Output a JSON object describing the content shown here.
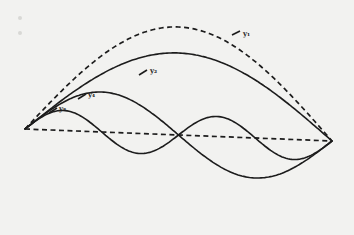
{
  "diagram": {
    "type": "standing-wave-modes",
    "endpoints": {
      "left": [
        25,
        129
      ],
      "right": [
        332,
        141
      ]
    },
    "baseline_style": "dashed",
    "curves": [
      {
        "id": "y1",
        "label": "y₁",
        "harmonic": 1,
        "amplitude": 108,
        "style": "dashed",
        "envelope": true,
        "label_pos": [
          243,
          36
        ],
        "leader": [
          [
            232,
            35
          ],
          [
            240,
            31
          ]
        ]
      },
      {
        "id": "y2",
        "label": "y₂",
        "harmonic": 2,
        "amplitude": 82,
        "style": "solid",
        "label_pos": [
          150,
          73
        ],
        "leader": [
          [
            139,
            75
          ],
          [
            147,
            70
          ]
        ]
      },
      {
        "id": "y4",
        "label": "y₄",
        "harmonic": 4,
        "amplitude": 40,
        "style": "solid",
        "label_pos": [
          88,
          97
        ],
        "leader": [
          [
            78,
            99
          ],
          [
            86,
            94
          ]
        ]
      },
      {
        "id": "y8",
        "label": "y₈",
        "harmonic": 8,
        "amplitude": 20,
        "style": "solid",
        "label_pos": [
          59,
          111
        ],
        "leader": [
          [
            49,
            113
          ],
          [
            57,
            108
          ]
        ]
      }
    ]
  }
}
